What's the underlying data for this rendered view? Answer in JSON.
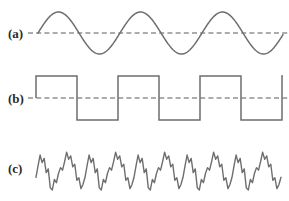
{
  "figure": {
    "background_color": "#ffffff",
    "stroke_color": "#6e6e6e",
    "baseline_color": "#5a5a5a",
    "label_color": "#2b2b2b",
    "width": 289,
    "height": 201
  },
  "panels": [
    {
      "id": "panel-a",
      "label": "(a)",
      "label_x": 8,
      "label_y": 38,
      "waveform": "sine",
      "baseline_visible": true,
      "baseline_y": 33,
      "baseline_x_start": 28,
      "baseline_x_end": 289,
      "x_start": 38,
      "x_end": 283,
      "amplitude": 21,
      "period": 82,
      "cycles": 3
    },
    {
      "id": "panel-b",
      "label": "(b)",
      "label_x": 8,
      "label_y": 103,
      "waveform": "square",
      "baseline_visible": true,
      "baseline_y": 98,
      "baseline_x_start": 28,
      "baseline_x_end": 289,
      "x_start": 36,
      "x_end": 283,
      "amplitude": 22,
      "period": 82,
      "cycles": 3
    },
    {
      "id": "panel-c",
      "label": "(c)",
      "label_x": 8,
      "label_y": 173,
      "waveform": "noise",
      "baseline_visible": false,
      "baseline_y": 171,
      "x_start": 36,
      "x_end": 283,
      "amplitude": 21,
      "period": 49,
      "cycles": 5
    }
  ],
  "chart_data": {
    "type": "line",
    "title": "",
    "xlabel": "",
    "ylabel": "",
    "grid": false,
    "legend_position": "left-labels",
    "series": [
      {
        "name": "(a)",
        "waveform_type": "sine",
        "cycles": 3,
        "period_px": 82,
        "amplitude_px": 21,
        "baseline_y_px": 33,
        "x_range_px": [
          38,
          283
        ],
        "has_dashed_baseline": true,
        "description": "smooth sinusoid, three full cycles starting upward from the baseline"
      },
      {
        "name": "(b)",
        "waveform_type": "square",
        "cycles": 3,
        "period_px": 82,
        "amplitude_px": 22,
        "baseline_y_px": 98,
        "x_range_px": [
          36,
          283
        ],
        "has_dashed_baseline": true,
        "duty_cycle": 0.5,
        "description": "square wave, three full cycles, high-then-low, same period as (a)"
      },
      {
        "name": "(c)",
        "waveform_type": "noise",
        "cycles": 5,
        "period_px": 49,
        "amplitude_px": 21,
        "baseline_y_px": 171,
        "x_range_px": [
          36,
          283
        ],
        "has_dashed_baseline": false,
        "description": "jagged quasi-periodic noisy signal with repeated double-peak and stepped decay, five repetitions",
        "period_profile": [
          0.35,
          0.62,
          0.88,
          0.7,
          0.8,
          0.46,
          0.55,
          0.1,
          0.05,
          0.3,
          0.22,
          0.44,
          0.58,
          0.52,
          0.72,
          0.95,
          0.78,
          0.86,
          0.6,
          0.66,
          0.28,
          0.34,
          0.08,
          0.18
        ]
      }
    ]
  }
}
